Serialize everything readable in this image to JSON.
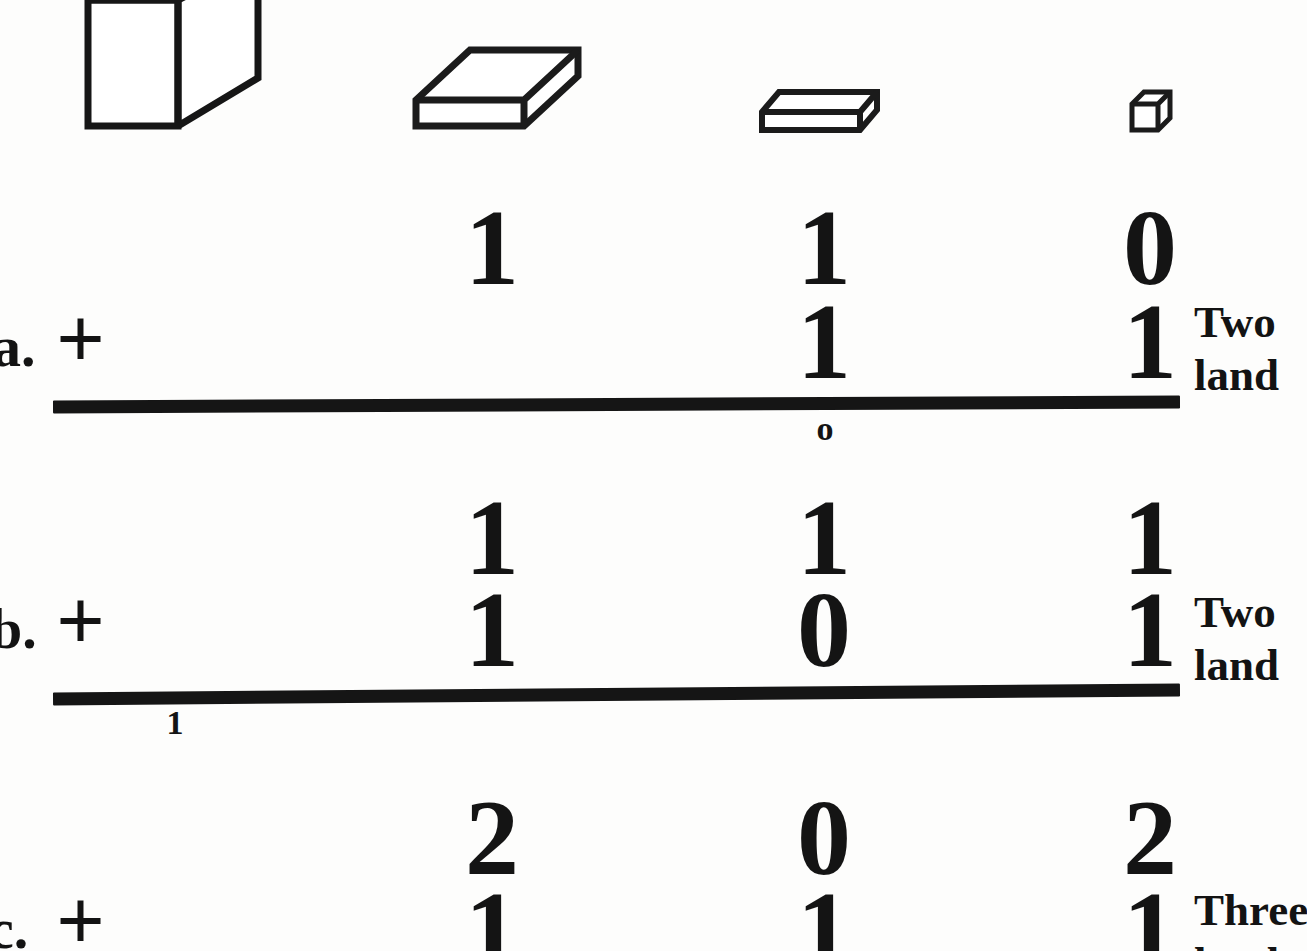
{
  "page": {
    "kind": "place-value-addition-worksheet",
    "background_color": "#fdfdfc",
    "ink_color": "#141414"
  },
  "blocks_legend": {
    "items": [
      {
        "icon": "large-cube-block",
        "name": "thousands-cube",
        "place": "thousands"
      },
      {
        "icon": "flat-block",
        "name": "hundreds-flat",
        "place": "hundreds"
      },
      {
        "icon": "long-rod-block",
        "name": "tens-long",
        "place": "tens"
      },
      {
        "icon": "unit-cube-block",
        "name": "ones-unit",
        "place": "ones"
      }
    ]
  },
  "problems": [
    {
      "letter": "a.",
      "operator": "+",
      "addend_top": {
        "hundreds": "1",
        "tens": "1",
        "ones": "0"
      },
      "addend_bottom": {
        "hundreds": "",
        "tens": "1",
        "ones": "1"
      },
      "carry_mark": "o",
      "note_line1": "Two",
      "note_line2": "land"
    },
    {
      "letter": "b.",
      "operator": "+",
      "addend_top": {
        "hundreds": "1",
        "tens": "1",
        "ones": "1"
      },
      "addend_bottom": {
        "hundreds": "1",
        "tens": "0",
        "ones": "1"
      },
      "carry_mark": "1",
      "note_line1": "Two",
      "note_line2": "land"
    },
    {
      "letter": "c.",
      "operator": "+",
      "addend_top": {
        "hundreds": "2",
        "tens": "0",
        "ones": "2"
      },
      "addend_bottom": {
        "hundreds": "1",
        "tens": "1",
        "ones": "1"
      },
      "carry_mark": "",
      "note_line1": "Three",
      "note_line2": "land"
    }
  ]
}
